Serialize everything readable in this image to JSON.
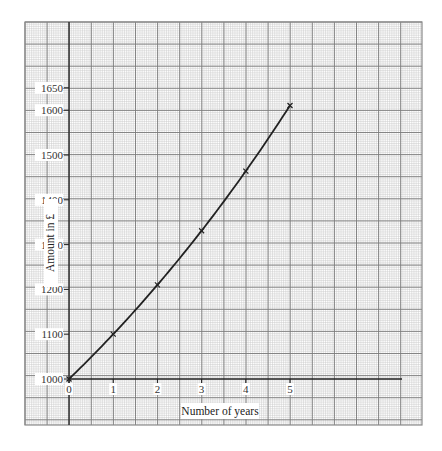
{
  "chart_data": {
    "type": "line",
    "title": "",
    "xlabel": "Number of years",
    "ylabel": "Amount in £",
    "x": [
      0,
      1,
      2,
      3,
      4,
      5
    ],
    "series": [
      {
        "name": "Amount",
        "values": [
          1000,
          1100,
          1210,
          1331,
          1464.1,
          1610.51
        ],
        "marker": "x",
        "color": "#222222"
      }
    ],
    "x_ticks": [
      "0",
      "1",
      "2",
      "3",
      "4",
      "5"
    ],
    "y_ticks": [
      "1000",
      "1100",
      "1200",
      "1300",
      "1400",
      "1500",
      "1600",
      "1650"
    ],
    "xlim": [
      -1.0,
      8.0
    ],
    "ylim": [
      900,
      1800
    ],
    "grid": true,
    "grid_style": "graph paper (major every 0.5 x-units / 50 y-units, 10 minor subdivisions)",
    "legend": "none"
  },
  "colors": {
    "paper": "#ffffff",
    "minor_grid": "#c8c8c8",
    "major_grid": "#7a7a7a",
    "axis": "#222222",
    "curve": "#222222"
  },
  "labels": {
    "x_axis_title": "Number of years",
    "y_axis_title": "Amount in £"
  }
}
